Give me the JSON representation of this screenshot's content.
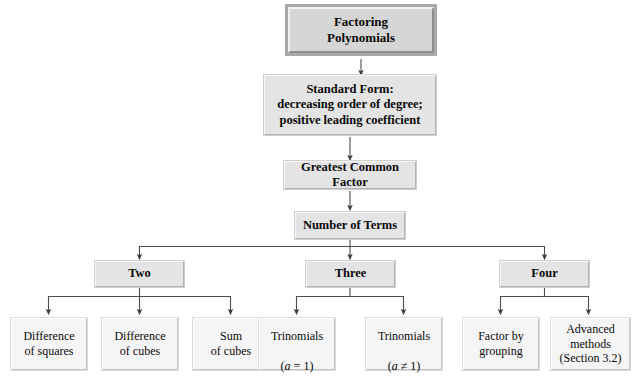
{
  "diagram": {
    "title_node": {
      "label": "Factoring\nPolynomials"
    },
    "process_nodes": [
      {
        "label": "Standard Form:\ndecreasing order of degree;\npositive leading coefficient"
      },
      {
        "label": "Greatest Common Factor"
      },
      {
        "label": "Number of Terms"
      }
    ],
    "branch_nodes": [
      {
        "label": "Two"
      },
      {
        "label": "Three"
      },
      {
        "label": "Four"
      }
    ],
    "leaf_nodes": [
      {
        "label": "Difference\nof squares"
      },
      {
        "label": "Difference\nof cubes"
      },
      {
        "label": "Sum\nof cubes"
      },
      {
        "label": "Trinomials",
        "formula_prefix": "(",
        "formula_var": "a",
        "formula_suffix": " = 1)"
      },
      {
        "label": "Trinomials",
        "formula_prefix": "(",
        "formula_var": "a",
        "formula_suffix": " ≠ 1)"
      },
      {
        "label": "Factor by\ngrouping"
      },
      {
        "label": "Advanced\nmethods\n(Section 3.2)"
      }
    ],
    "colors": {
      "root_fill": "#d6d6d6",
      "mid_fill": "#e4e4e4",
      "leaf_fill": "#f5f5f5",
      "connector": "#4d4d4d",
      "text": "#0a0a0a"
    }
  }
}
